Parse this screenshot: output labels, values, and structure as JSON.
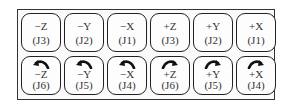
{
  "panel": {
    "translate_buttons": [
      {
        "axis": "−Z",
        "joint": "(J3)"
      },
      {
        "axis": "−Y",
        "joint": "(J2)"
      },
      {
        "axis": "−X",
        "joint": "(J1)"
      },
      {
        "axis": "+Z",
        "joint": "(J3)"
      },
      {
        "axis": "+Y",
        "joint": "(J2)"
      },
      {
        "axis": "+X",
        "joint": "(J1)"
      }
    ],
    "rotate_buttons": [
      {
        "axis": "−Z",
        "joint": "(J6)",
        "icon": "rotate-ccw-icon"
      },
      {
        "axis": "−Y",
        "joint": "(J5)",
        "icon": "rotate-ccw-icon"
      },
      {
        "axis": "−X",
        "joint": "(J4)",
        "icon": "rotate-ccw-icon"
      },
      {
        "axis": "+Z",
        "joint": "(J6)",
        "icon": "rotate-cw-icon"
      },
      {
        "axis": "+Y",
        "joint": "(J5)",
        "icon": "rotate-cw-icon"
      },
      {
        "axis": "+X",
        "joint": "(J4)",
        "icon": "rotate-cw-icon"
      }
    ]
  }
}
